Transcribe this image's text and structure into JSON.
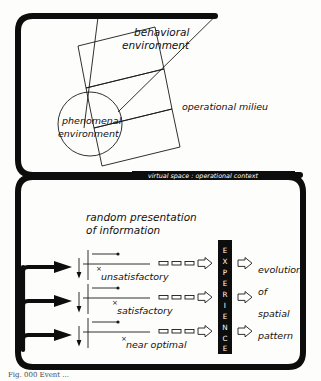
{
  "figure": {
    "caption": "Fig. 000   Event ...",
    "upper_panel": {
      "name": "virtual space panel",
      "band_label": "virtual space : operational context",
      "labels": [
        {
          "id": "behavioral-environment",
          "line1": "behavioral",
          "line2": "environment"
        },
        {
          "id": "operational-milieu",
          "line1": "operational milieu",
          "line2": ""
        },
        {
          "id": "phenomenal-environment",
          "line1": "phenomenal",
          "line2": "environment"
        }
      ]
    },
    "lower_panel": {
      "name": "process panel",
      "heading": {
        "line1": "random presentation",
        "line2": "of information"
      },
      "rows": [
        {
          "id": "row-unsatisfactory",
          "marker": "×",
          "label": "unsatisfactory"
        },
        {
          "id": "row-satisfactory",
          "marker": "×",
          "label": "satisfactory"
        },
        {
          "id": "row-near-optimal",
          "marker": "×",
          "label": "near optimal"
        }
      ],
      "experience_box": {
        "label": "EXPERIENCE",
        "letters": [
          "E",
          "X",
          "P",
          "E",
          "R",
          "I",
          "E",
          "N",
          "C",
          "E"
        ]
      },
      "outcome": {
        "lines": [
          "evolution",
          "of",
          "spatial",
          "pattern"
        ]
      }
    }
  },
  "colors": {
    "ink": "#0d0d0d",
    "paper": "#fdfdfb",
    "hairline": "#1a1a1a",
    "white": "#ffffff"
  }
}
